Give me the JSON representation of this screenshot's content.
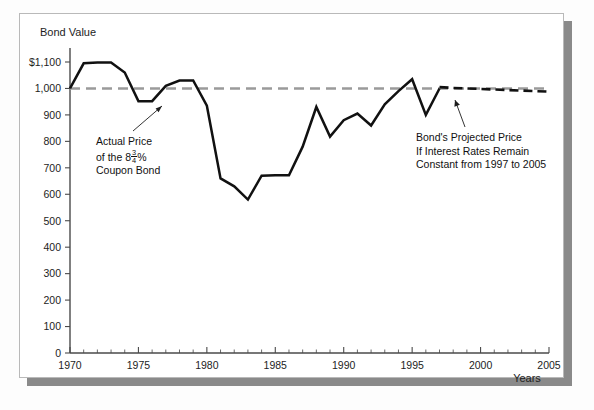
{
  "figure": {
    "y_axis_title": "Bond Value",
    "x_axis_title": "Years"
  },
  "annotations": {
    "left": {
      "line1": "Actual Price",
      "line2_prefix": "of the 8",
      "line2_num": "3",
      "line2_den": "4",
      "line2_suffix": "%",
      "line3": "Coupon Bond"
    },
    "right": {
      "line1": "Bond's Projected Price",
      "line2": "If Interest Rates Remain",
      "line3": "Constant from 1997 to 2005"
    }
  },
  "colors": {
    "actual_line": "#111111",
    "projected_line": "#111111",
    "reference_line": "#9a9a9a",
    "axis": "#4a4a4a",
    "plate_border": "#b9b9b9",
    "shadow": "#8a8a8a"
  },
  "chart_data": {
    "type": "line",
    "title": "",
    "xlabel": "Years",
    "ylabel": "Bond Value",
    "xlim": [
      1970,
      2005
    ],
    "ylim": [
      0,
      1100
    ],
    "ytick_labels": [
      "0",
      "100",
      "200",
      "300",
      "400",
      "500",
      "600",
      "700",
      "800",
      "900",
      "1,000",
      "$1,100"
    ],
    "ytick_values": [
      0,
      100,
      200,
      300,
      400,
      500,
      600,
      700,
      800,
      900,
      1000,
      1100
    ],
    "xtick_labels": [
      "1970",
      "1975",
      "1980",
      "1985",
      "1990",
      "1995",
      "2000",
      "2005"
    ],
    "xtick_values": [
      1970,
      1975,
      1980,
      1985,
      1990,
      1995,
      2000,
      2005
    ],
    "xtick_minor_step": 1,
    "grid": false,
    "legend": null,
    "series": [
      {
        "name": "Actual Price of the 8 3/4% Coupon Bond",
        "style": "solid",
        "color": "#111111",
        "x": [
          1970,
          1971,
          1972,
          1973,
          1974,
          1975,
          1976,
          1977,
          1978,
          1979,
          1980,
          1981,
          1982,
          1983,
          1984,
          1985,
          1986,
          1987,
          1988,
          1989,
          1990,
          1991,
          1992,
          1993,
          1994,
          1995,
          1996,
          1997
        ],
        "y": [
          1000,
          1095,
          1098,
          1098,
          1060,
          952,
          952,
          1010,
          1030,
          1030,
          935,
          660,
          630,
          580,
          670,
          672,
          672,
          780,
          930,
          818,
          880,
          905,
          860,
          940,
          990,
          1035,
          900,
          1000
        ]
      },
      {
        "name": "Bond's Projected Price If Interest Rates Remain Constant from 1997 to 2005",
        "style": "dashed",
        "color": "#111111",
        "x": [
          1997,
          1998,
          1999,
          2000,
          2001,
          2002,
          2003,
          2004,
          2005
        ],
        "y": [
          1005,
          1002,
          1000,
          998,
          996,
          994,
          992,
          990,
          988
        ]
      },
      {
        "name": "Par value reference ($1,000)",
        "style": "dashed-gray",
        "color": "#9a9a9a",
        "x": [
          1970,
          2005
        ],
        "y": [
          1000,
          1000
        ]
      }
    ]
  }
}
